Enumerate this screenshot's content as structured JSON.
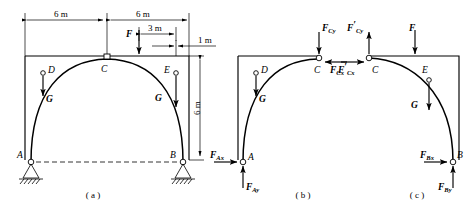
{
  "figure": {
    "panels": [
      {
        "id": "a",
        "caption": "( a )"
      },
      {
        "id": "b",
        "caption": "( b )"
      },
      {
        "id": "c",
        "caption": "( c )"
      }
    ]
  },
  "dimensions": {
    "span_left": "6 m",
    "span_right": "6 m",
    "offset_F": "3 m",
    "offset_E": "1 m",
    "height": "6 m"
  },
  "points": {
    "A": "A",
    "B": "B",
    "C": "C",
    "D": "D",
    "E": "E"
  },
  "loads": {
    "F": "F",
    "G_left": "G",
    "G_right": "G"
  },
  "reactions": {
    "Ax": {
      "base": "F",
      "sub": "Ax",
      "prime": false
    },
    "Ay": {
      "base": "F",
      "sub": "Ay",
      "prime": false
    },
    "Cy": {
      "base": "F",
      "sub": "Cy",
      "prime": false
    },
    "Cx": {
      "base": "F",
      "sub": "Cx",
      "prime": false
    },
    "Cyp": {
      "base": "F",
      "sub": "Cy",
      "prime": true
    },
    "Cxp": {
      "base": "F",
      "sub": "Cx",
      "prime": true
    },
    "Bx": {
      "base": "F",
      "sub": "Bx",
      "prime": false
    },
    "By": {
      "base": "F",
      "sub": "By",
      "prime": false
    }
  },
  "panel_a": {
    "point_A": "A",
    "point_B": "B",
    "point_C": "C",
    "point_D": "D",
    "point_E": "E",
    "load_F": "F",
    "load_G_left": "G",
    "load_G_right": "G",
    "dim_left": "6 m",
    "dim_right": "6 m",
    "dim_3m": "3 m",
    "dim_1m": "1 m",
    "dim_height": "6 m",
    "caption": "( a )"
  },
  "panel_b": {
    "point_A": "A",
    "point_C": "C",
    "point_D": "D",
    "load_G": "G",
    "caption": "( b )"
  },
  "panel_c": {
    "point_B": "B",
    "point_C": "C",
    "point_E": "E",
    "load_F": "F",
    "load_G": "G",
    "caption": "( c )"
  },
  "colors": {
    "line": "#000000",
    "background": "#ffffff"
  }
}
